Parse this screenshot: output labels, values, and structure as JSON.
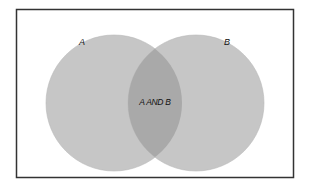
{
  "diagram": {
    "type": "venn",
    "sets": [
      {
        "label": "A",
        "fill": "#c4c4c4"
      },
      {
        "label": "B",
        "fill": "#c4c4c4"
      }
    ],
    "intersection": {
      "label": "A AND B",
      "fill": "#a8a8a8"
    },
    "frame_color": "#333333"
  }
}
